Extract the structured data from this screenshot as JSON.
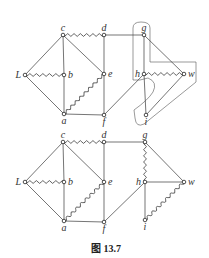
{
  "caption": "图 13.7",
  "graphs": [
    {
      "id": "top",
      "vertices": [
        {
          "id": "c",
          "label": "c"
        },
        {
          "id": "d",
          "label": "d"
        },
        {
          "id": "g",
          "label": "g"
        },
        {
          "id": "L",
          "label": "L"
        },
        {
          "id": "b",
          "label": "b"
        },
        {
          "id": "e",
          "label": "e"
        },
        {
          "id": "h",
          "label": "h"
        },
        {
          "id": "w",
          "label": "w"
        },
        {
          "id": "a",
          "label": "a"
        },
        {
          "id": "f",
          "label": "f"
        },
        {
          "id": "i",
          "label": "i"
        }
      ],
      "edges": [
        {
          "from": "c",
          "to": "d",
          "style": "wavy"
        },
        {
          "from": "d",
          "to": "g",
          "style": "straight"
        },
        {
          "from": "c",
          "to": "L",
          "style": "straight"
        },
        {
          "from": "c",
          "to": "b",
          "style": "straight"
        },
        {
          "from": "c",
          "to": "e",
          "style": "straight"
        },
        {
          "from": "L",
          "to": "b",
          "style": "wavy"
        },
        {
          "from": "L",
          "to": "a",
          "style": "straight"
        },
        {
          "from": "b",
          "to": "a",
          "style": "straight"
        },
        {
          "from": "a",
          "to": "e",
          "style": "wavy"
        },
        {
          "from": "a",
          "to": "f",
          "style": "straight"
        },
        {
          "from": "d",
          "to": "e",
          "style": "straight"
        },
        {
          "from": "e",
          "to": "f",
          "style": "straight"
        },
        {
          "from": "f",
          "to": "h",
          "style": "straight"
        },
        {
          "from": "g",
          "to": "h",
          "style": "straight"
        },
        {
          "from": "g",
          "to": "w",
          "style": "straight"
        },
        {
          "from": "h",
          "to": "w",
          "style": "wavy"
        },
        {
          "from": "h",
          "to": "i",
          "style": "straight"
        },
        {
          "from": "i",
          "to": "w",
          "style": "straight"
        }
      ],
      "has_outline": true
    },
    {
      "id": "bottom",
      "vertices": [
        {
          "id": "c",
          "label": "c"
        },
        {
          "id": "d",
          "label": "d"
        },
        {
          "id": "g",
          "label": "g"
        },
        {
          "id": "L",
          "label": "L"
        },
        {
          "id": "b",
          "label": "b"
        },
        {
          "id": "e",
          "label": "e"
        },
        {
          "id": "h",
          "label": "h"
        },
        {
          "id": "w",
          "label": "w"
        },
        {
          "id": "a",
          "label": "a"
        },
        {
          "id": "f",
          "label": "f"
        },
        {
          "id": "i",
          "label": "i"
        }
      ],
      "edges": [
        {
          "from": "c",
          "to": "d",
          "style": "wavy"
        },
        {
          "from": "d",
          "to": "g",
          "style": "straight"
        },
        {
          "from": "c",
          "to": "L",
          "style": "straight"
        },
        {
          "from": "c",
          "to": "b",
          "style": "straight"
        },
        {
          "from": "c",
          "to": "e",
          "style": "straight"
        },
        {
          "from": "L",
          "to": "b",
          "style": "wavy"
        },
        {
          "from": "L",
          "to": "a",
          "style": "straight"
        },
        {
          "from": "b",
          "to": "a",
          "style": "straight"
        },
        {
          "from": "a",
          "to": "e",
          "style": "wavy"
        },
        {
          "from": "a",
          "to": "f",
          "style": "straight"
        },
        {
          "from": "d",
          "to": "e",
          "style": "straight"
        },
        {
          "from": "e",
          "to": "f",
          "style": "straight"
        },
        {
          "from": "f",
          "to": "h",
          "style": "straight"
        },
        {
          "from": "g",
          "to": "h",
          "style": "wavy"
        },
        {
          "from": "g",
          "to": "w",
          "style": "straight"
        },
        {
          "from": "h",
          "to": "w",
          "style": "straight"
        },
        {
          "from": "h",
          "to": "i",
          "style": "straight"
        },
        {
          "from": "i",
          "to": "w",
          "style": "wavy"
        }
      ],
      "has_outline": false
    }
  ]
}
